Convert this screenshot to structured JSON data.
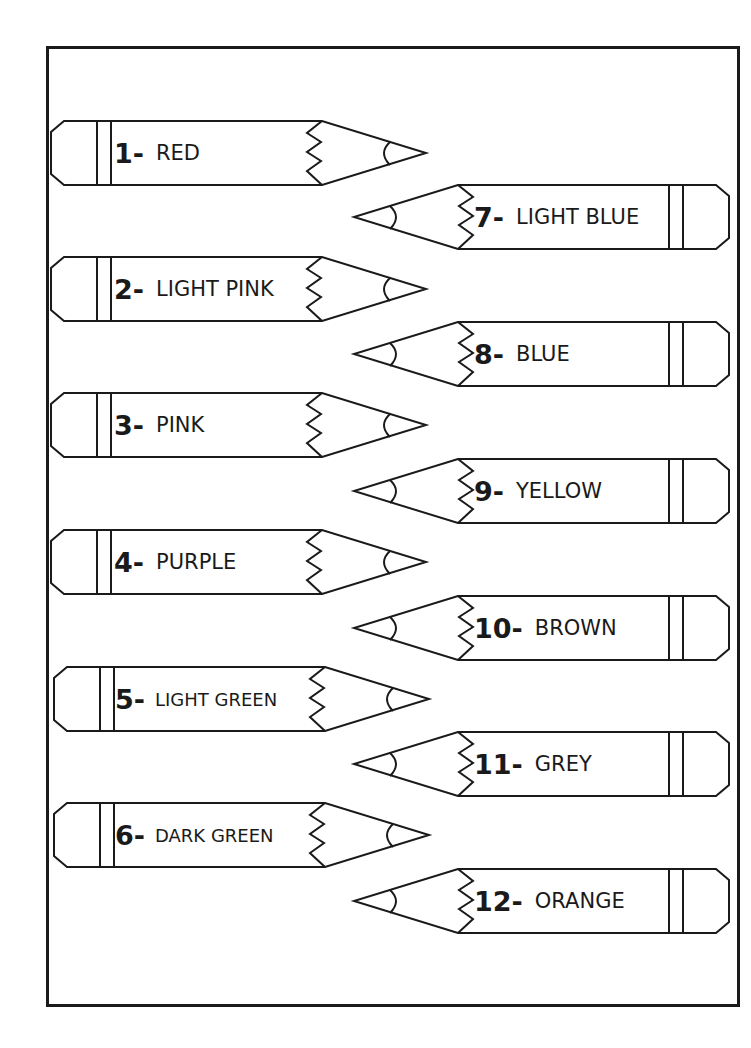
{
  "worksheet": {
    "pencils": [
      {
        "number": "1-",
        "color": "RED",
        "side": "left",
        "top": 120
      },
      {
        "number": "2-",
        "color": "LIGHT PINK",
        "side": "left",
        "top": 256
      },
      {
        "number": "3-",
        "color": "PINK",
        "side": "left",
        "top": 392
      },
      {
        "number": "4-",
        "color": "PURPLE",
        "side": "left",
        "top": 529
      },
      {
        "number": "5-",
        "color": "LIGHT GREEN",
        "side": "left",
        "top": 666
      },
      {
        "number": "6-",
        "color": "DARK GREEN",
        "side": "left",
        "top": 802
      },
      {
        "number": "7-",
        "color": "LIGHT BLUE",
        "side": "right",
        "top": 184
      },
      {
        "number": "8-",
        "color": "BLUE",
        "side": "right",
        "top": 321
      },
      {
        "number": "9-",
        "color": "YELLOW",
        "side": "right",
        "top": 458
      },
      {
        "number": "10-",
        "color": "BROWN",
        "side": "right",
        "top": 595
      },
      {
        "number": "11-",
        "color": "GREY",
        "side": "right",
        "top": 731
      },
      {
        "number": "12-",
        "color": "ORANGE",
        "side": "right",
        "top": 868
      }
    ],
    "line_color": "#1a1a1a",
    "background": "#ffffff"
  }
}
